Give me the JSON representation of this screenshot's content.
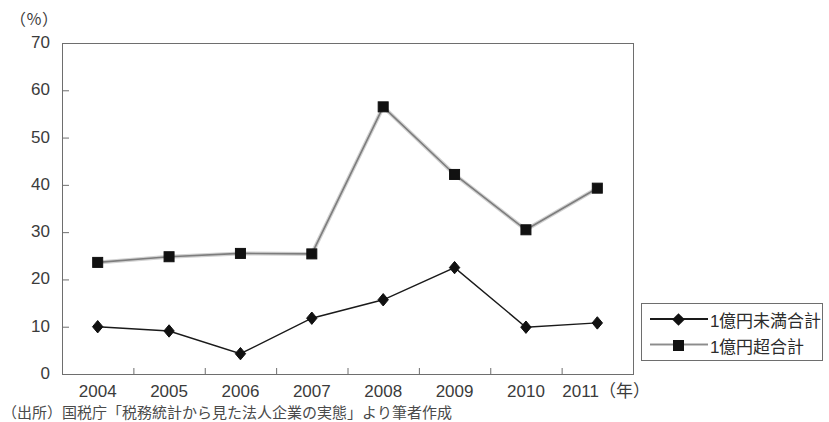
{
  "axis": {
    "unit_label": "（％）",
    "y_ticks": [
      "70",
      "60",
      "50",
      "40",
      "30",
      "20",
      "10",
      "0"
    ],
    "x_ticks": [
      "2004",
      "2005",
      "2006",
      "2007",
      "2008",
      "2009",
      "2010",
      "2011"
    ],
    "x_unit_suffix": "（年）",
    "x_last_label": "2011（年）"
  },
  "legend": {
    "entries": [
      {
        "label": "1億円未満合計",
        "marker": "diamond-marker-icon",
        "color": "#111111"
      },
      {
        "label": "1億円超合計",
        "marker": "square-marker-icon",
        "color": "#111111"
      }
    ]
  },
  "source": {
    "text": "（出所）国税庁「税務統計から見た法人企業の実態」より筆者作成"
  },
  "colors": {
    "frame": "#6e6e6e",
    "series_under": "#1a1a1a",
    "series_over": "#8c8c8c",
    "text": "#3b3b3b"
  },
  "chart_data": {
    "type": "line",
    "title": "",
    "xlabel": "（年）",
    "ylabel": "（％）",
    "ylim": [
      0,
      70
    ],
    "ytick_step": 10,
    "grid": false,
    "legend_position": "right",
    "categories": [
      "2004",
      "2005",
      "2006",
      "2007",
      "2008",
      "2009",
      "2010",
      "2011"
    ],
    "series": [
      {
        "name": "1億円未満合計",
        "marker": "diamond",
        "color": "#1a1a1a",
        "values": [
          10.0,
          9.1,
          4.3,
          11.8,
          15.7,
          22.5,
          9.9,
          10.8
        ]
      },
      {
        "name": "1億円超合計",
        "marker": "square",
        "color": "#8c8c8c",
        "values": [
          23.6,
          24.8,
          25.5,
          25.4,
          56.5,
          42.2,
          30.5,
          39.3
        ]
      }
    ]
  }
}
